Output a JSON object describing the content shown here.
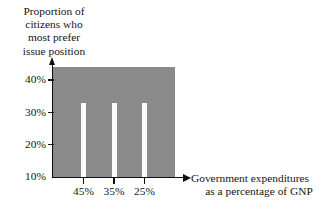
{
  "chart_data": {
    "type": "bar",
    "title": "",
    "categories": [
      "45%",
      "35%",
      "25%"
    ],
    "values": [
      33,
      33,
      33
    ],
    "series": [
      {
        "name": "Proportion of citizens who most prefer issue position",
        "values": [
          33,
          33,
          33
        ]
      }
    ],
    "ylabel_lines": [
      "Proportion of",
      "citizens who",
      "most prefer",
      "issue position"
    ],
    "xlabel_lines": [
      "Government expenditures",
      "as a percentage of GNP"
    ],
    "ylabel": "Proportion of citizens who most prefer issue position",
    "xlabel": "Government expenditures as a percentage of GNP",
    "yticks": [
      "40%",
      "30%",
      "20%",
      "10%"
    ],
    "ytick_values": [
      40,
      30,
      20,
      10
    ],
    "xticks": [
      "45%",
      "35%",
      "25%"
    ],
    "ylim": [
      10,
      44
    ],
    "xlim": [
      0,
      4
    ],
    "grid": false,
    "legend": "none",
    "plot_background_color": "#8a8a8a",
    "bar_color": "#fbfbfb",
    "axis_color": "#101010",
    "page_background_color": "#ffffff",
    "y_axis_arrow": true,
    "x_axis_arrow": true
  }
}
